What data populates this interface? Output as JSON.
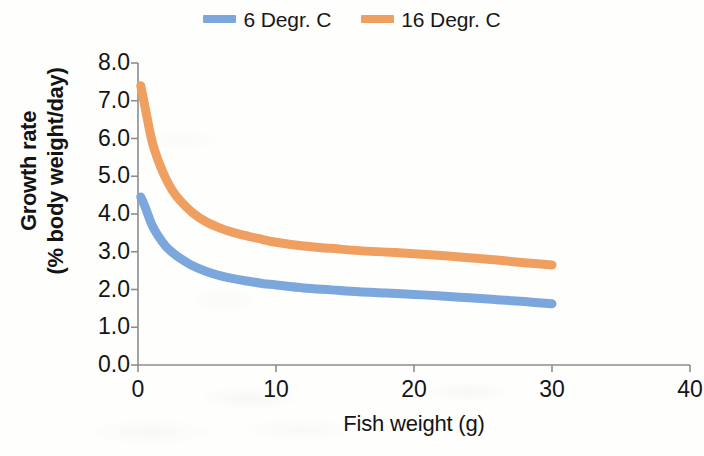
{
  "chart_data": {
    "type": "line",
    "title": "",
    "subtitle": "",
    "xlabel": "Fish weight (g)",
    "ylabel": "Growth rate\n(% body weight/day)",
    "ylabel_lines": [
      "Growth rate",
      "(% body weight/day)"
    ],
    "xlim": [
      0,
      40
    ],
    "ylim": [
      0,
      8
    ],
    "xticks": [
      "0",
      "10",
      "20",
      "30",
      "40"
    ],
    "xtick_values": [
      0,
      10,
      20,
      30,
      40
    ],
    "yticks": [
      "0.0",
      "1.0",
      "2.0",
      "3.0",
      "4.0",
      "5.0",
      "6.0",
      "7.0",
      "8.0"
    ],
    "ytick_values": [
      0,
      1,
      2,
      3,
      4,
      5,
      6,
      7,
      8
    ],
    "grid": false,
    "legend_position": "top-center",
    "x": [
      0.2,
      0.5,
      1,
      1.5,
      2,
      2.5,
      3,
      4,
      5,
      6,
      7,
      8,
      9,
      10,
      12,
      14,
      16,
      18,
      20,
      22,
      24,
      26,
      28,
      30
    ],
    "series": [
      {
        "name": "6 Degr. C",
        "color": "#7BA7DC",
        "values": [
          4.45,
          4.2,
          3.72,
          3.4,
          3.15,
          2.98,
          2.84,
          2.62,
          2.47,
          2.36,
          2.28,
          2.22,
          2.16,
          2.12,
          2.04,
          1.99,
          1.94,
          1.91,
          1.87,
          1.83,
          1.78,
          1.73,
          1.68,
          1.62
        ]
      },
      {
        "name": "16 Degr. C",
        "color": "#EF9F5F",
        "values": [
          7.4,
          6.85,
          5.95,
          5.38,
          4.95,
          4.62,
          4.38,
          4.02,
          3.78,
          3.62,
          3.5,
          3.41,
          3.33,
          3.25,
          3.15,
          3.09,
          3.03,
          2.99,
          2.95,
          2.9,
          2.84,
          2.78,
          2.71,
          2.65
        ]
      }
    ],
    "legend": [
      {
        "label": "6 Degr. C",
        "color": "#7BA7DC"
      },
      {
        "label": "16 Degr. C",
        "color": "#EF9F5F"
      }
    ],
    "axis_color": "#8d8d8d"
  }
}
